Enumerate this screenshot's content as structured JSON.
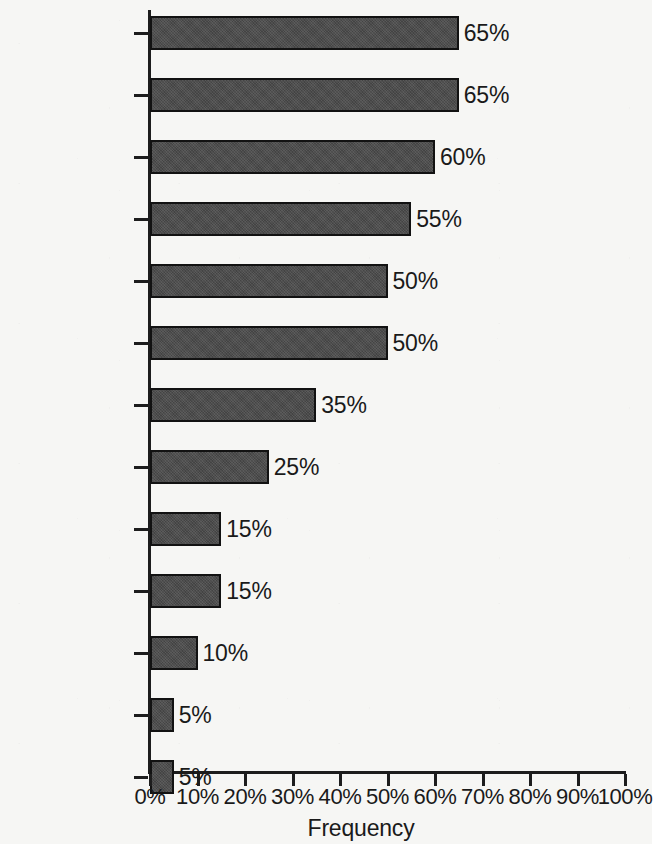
{
  "chart_data": {
    "type": "bar",
    "orientation": "horizontal",
    "title": "",
    "xlabel": "Frequency",
    "ylabel": "",
    "xlim": [
      0,
      100
    ],
    "grid": false,
    "legend": null,
    "x_tick_labels": [
      "0%",
      "10%",
      "20%",
      "30%",
      "40%",
      "50%",
      "60%",
      "70%",
      "80%",
      "90%",
      "100%"
    ],
    "x_ticks": [
      0,
      10,
      20,
      30,
      40,
      50,
      60,
      70,
      80,
      90,
      100
    ],
    "categories": [
      "Fever",
      "Anorexia",
      "Nausea",
      "Abdominal\nPain",
      "Malaise",
      "Jaundice",
      "Vomiting",
      "Myalgia",
      "Diarrhea",
      "Asympomatic",
      "Headache",
      "Rash",
      "Arthralgia"
    ],
    "values": [
      65,
      65,
      60,
      55,
      50,
      50,
      35,
      25,
      15,
      15,
      10,
      5,
      5
    ],
    "value_labels": [
      "65%",
      "65%",
      "60%",
      "55%",
      "50%",
      "50%",
      "35%",
      "25%",
      "15%",
      "15%",
      "10%",
      "5%",
      "5%"
    ],
    "bar_color": "#4a4a4a",
    "bar_edge_color": "#121212",
    "axis_color": "#1d1d1d",
    "background_color": "#f6f6f4"
  }
}
